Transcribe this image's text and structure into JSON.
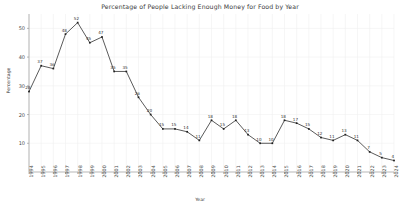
{
  "chart_data": {
    "type": "line",
    "title": "Percentage of People Lacking Enough Money for Food by Year",
    "xlabel": "Year",
    "ylabel": "Percentage",
    "grid": true,
    "legend": null,
    "legend_position": "none",
    "line_color": "#3c3c3c",
    "marker": "square",
    "marker_color": "#1f1f1f",
    "grid_color": "#f0f0f0",
    "axis_color": "#9a9a9a",
    "background": "#ffffff",
    "xlim_categories": [
      "1994",
      "2024"
    ],
    "ylim": [
      0,
      55
    ],
    "yticks": [
      10,
      20,
      30,
      40,
      50
    ],
    "ytick_labels": [
      "10",
      "20",
      "30",
      "40",
      "50"
    ],
    "categories": [
      "1994",
      "1995",
      "1996",
      "1997",
      "1998",
      "1999",
      "2000",
      "2001",
      "2002",
      "2003",
      "2004",
      "2005",
      "2006",
      "2007",
      "2008",
      "2009",
      "2010",
      "2011",
      "2012",
      "2013",
      "2014",
      "2015",
      "2016",
      "2017",
      "2018",
      "2019",
      "2020",
      "2021",
      "2022",
      "2023",
      "2024"
    ],
    "values": [
      28,
      37,
      36,
      48,
      52,
      45,
      47,
      35,
      35,
      26,
      20,
      15,
      15,
      14,
      11,
      18,
      15,
      18,
      13,
      10,
      10,
      18,
      17,
      15,
      12,
      11,
      13,
      11,
      7,
      5,
      4
    ],
    "point_labels": [
      "28",
      "37",
      "36",
      "48",
      "52",
      "45",
      "47",
      "35",
      "35",
      "26",
      "20",
      "15",
      "15",
      "14",
      "11",
      "18",
      "15",
      "18",
      "13",
      "10",
      "10",
      "18",
      "17",
      "15",
      "12",
      "11",
      "13",
      "11",
      "7",
      "5",
      "4"
    ]
  }
}
